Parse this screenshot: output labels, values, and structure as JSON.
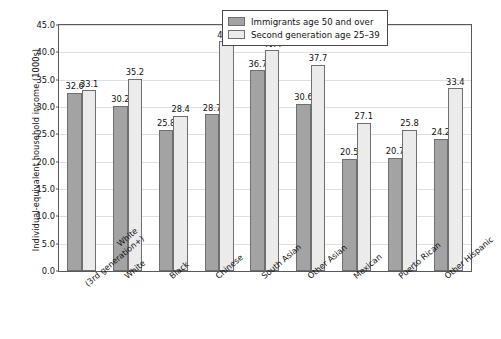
{
  "chart_data": {
    "type": "bar",
    "title": "",
    "xlabel": "",
    "ylabel": "Individual-equivalent household income (1000s)",
    "ylim": [
      0,
      45
    ],
    "ytick_step": 5,
    "ytick_labels": [
      "0.0",
      "5.0",
      "10.0",
      "15.0",
      "20.0",
      "25.0",
      "30.0",
      "35.0",
      "40.0",
      "45.0"
    ],
    "grid": true,
    "legend_position": "top-right",
    "categories": [
      {
        "line1": "White",
        "line2": "(3rd generation+)"
      },
      {
        "line1": "White",
        "line2": ""
      },
      {
        "line1": "Black",
        "line2": ""
      },
      {
        "line1": "Chinese",
        "line2": ""
      },
      {
        "line1": "South Asian",
        "line2": ""
      },
      {
        "line1": "Other Asian",
        "line2": ""
      },
      {
        "line1": "Mexican",
        "line2": ""
      },
      {
        "line1": "Puerto Rican",
        "line2": ""
      },
      {
        "line1": "Other Hispanic",
        "line2": ""
      }
    ],
    "series": [
      {
        "name": "Immigrants age 50 and over",
        "color": "#a3a3a3",
        "values": [
          32.6,
          30.2,
          25.8,
          28.7,
          36.7,
          30.6,
          20.5,
          20.7,
          24.2
        ],
        "labels": [
          "32.6",
          "30.2",
          "25.8",
          "28.7",
          "36.7",
          "30.6",
          "20.5",
          "20.7",
          "24.2"
        ]
      },
      {
        "name": "Second generation age 25–39",
        "color": "#ebebeb",
        "values": [
          33.1,
          35.2,
          28.4,
          42.0,
          40.4,
          37.7,
          27.1,
          25.8,
          33.4
        ],
        "labels": [
          "33.1",
          "35.2",
          "28.4",
          "42.0",
          "40.4",
          "37.7",
          "27.1",
          "25.8",
          "33.4"
        ]
      }
    ]
  },
  "legend": {
    "items": [
      {
        "label": "Immigrants age 50 and over"
      },
      {
        "label": "Second generation age 25–39"
      }
    ]
  }
}
